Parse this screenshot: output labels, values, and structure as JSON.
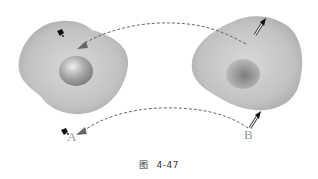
{
  "figure": {
    "caption_prefix": "图",
    "caption_number": "4-47"
  },
  "labels": {
    "a": "A",
    "b": "B"
  },
  "colors": {
    "blob_fill": "#b5b5b5",
    "dashed_line": "#666666",
    "arrow_head": "#666666",
    "label": "#999999"
  },
  "shapes": [
    {
      "name": "left-blob",
      "content": "raised sphere"
    },
    {
      "name": "right-blob",
      "content": "concave dimple"
    }
  ]
}
